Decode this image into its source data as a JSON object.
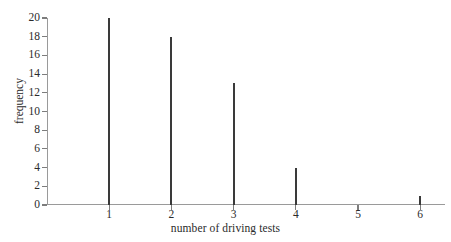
{
  "chart_data": {
    "type": "bar",
    "title": "",
    "subtitle": "",
    "xlabel": "number of driving tests",
    "ylabel": "frequency",
    "categories": [
      "1",
      "2",
      "3",
      "4",
      "5",
      "6"
    ],
    "values": [
      20,
      18,
      13,
      4,
      0,
      1
    ],
    "series": [
      {
        "name": "frequency",
        "values": [
          20,
          18,
          13,
          4,
          0,
          1
        ]
      }
    ],
    "xlim": [
      0,
      6.4
    ],
    "ylim": [
      0,
      20
    ],
    "xticks": [
      "1",
      "2",
      "3",
      "4",
      "5",
      "6"
    ],
    "yticks": [
      "0",
      "2",
      "4",
      "6",
      "8",
      "10",
      "12",
      "14",
      "16",
      "18",
      "20"
    ],
    "grid": false,
    "legend": false,
    "legend_position": "none",
    "annotations": [],
    "bar_color": "#3a3a3a",
    "axis_color": "#9a9a9a",
    "text_color": "#2b2b2b",
    "background": "#ffffff"
  }
}
